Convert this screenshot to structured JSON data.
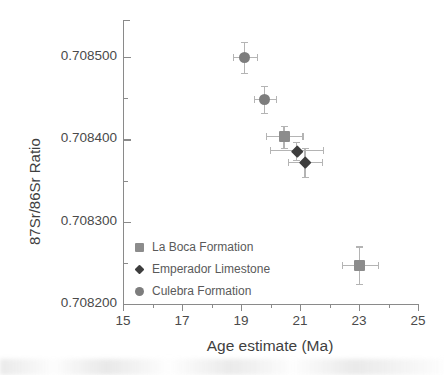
{
  "chart_data": {
    "type": "scatter",
    "title": "",
    "xlabel": "Age estimate (Ma)",
    "ylabel": "87Sr/86Sr Ratio",
    "xlim": [
      15,
      25
    ],
    "ylim": [
      0.7082,
      0.70855
    ],
    "xticks": [
      15,
      17,
      19,
      21,
      23,
      25
    ],
    "xticklabels": [
      "15",
      "17",
      "19",
      "21",
      "23",
      "25"
    ],
    "xminorticks": [
      16,
      18,
      20,
      22,
      24
    ],
    "yticks": [
      0.7082,
      0.7083,
      0.7084,
      0.7085
    ],
    "yticklabels": [
      "0.708200",
      "0.708300",
      "0.708400",
      "0.708500"
    ],
    "yminorticks": [
      0.70825,
      0.70835,
      0.70845
    ],
    "grid": false,
    "legend_position": "lower-left",
    "series": [
      {
        "name": "La Boca Formation",
        "marker": "square",
        "color": "#8c8c8c",
        "points": [
          {
            "x": 20.46,
            "y": 0.708403,
            "xerr": 0.62,
            "yerr": 1.35e-05
          },
          {
            "x": 23.03,
            "y": 0.708247,
            "xerr": 0.62,
            "yerr": 2.3e-05
          }
        ]
      },
      {
        "name": "Emperador Limestone",
        "marker": "diamond",
        "color": "#3d3d3d",
        "points": [
          {
            "x": 20.89,
            "y": 0.708386,
            "xerr": 0.9,
            "yerr": 1.1e-05
          },
          {
            "x": 21.17,
            "y": 0.708372,
            "xerr": 0.57,
            "yerr": 1.75e-05
          }
        ]
      },
      {
        "name": "Culebra Formation",
        "marker": "circle",
        "color": "#7d7d7d",
        "points": [
          {
            "x": 19.13,
            "y": 0.7084995,
            "xerr": 0.4,
            "yerr": 1.85e-05
          },
          {
            "x": 19.81,
            "y": 0.7084486,
            "xerr": 0.36,
            "yerr": 1.65e-05
          }
        ]
      }
    ],
    "legend_entries": [
      {
        "label": "La Boca Formation",
        "marker": "square",
        "color": "#8c8c8c"
      },
      {
        "label": "Emperador Limestone",
        "marker": "diamond",
        "color": "#3d3d3d"
      },
      {
        "label": "Culebra Formation",
        "marker": "circle",
        "color": "#7d7d7d"
      }
    ]
  },
  "axes_geometry": {
    "left_px": 123,
    "right_px": 418,
    "top_px": 20,
    "bottom_px": 304
  },
  "colors": {
    "axis": "#8a8a8a",
    "error_bar": "#b4b4b4",
    "text": "#4a4a4a"
  }
}
